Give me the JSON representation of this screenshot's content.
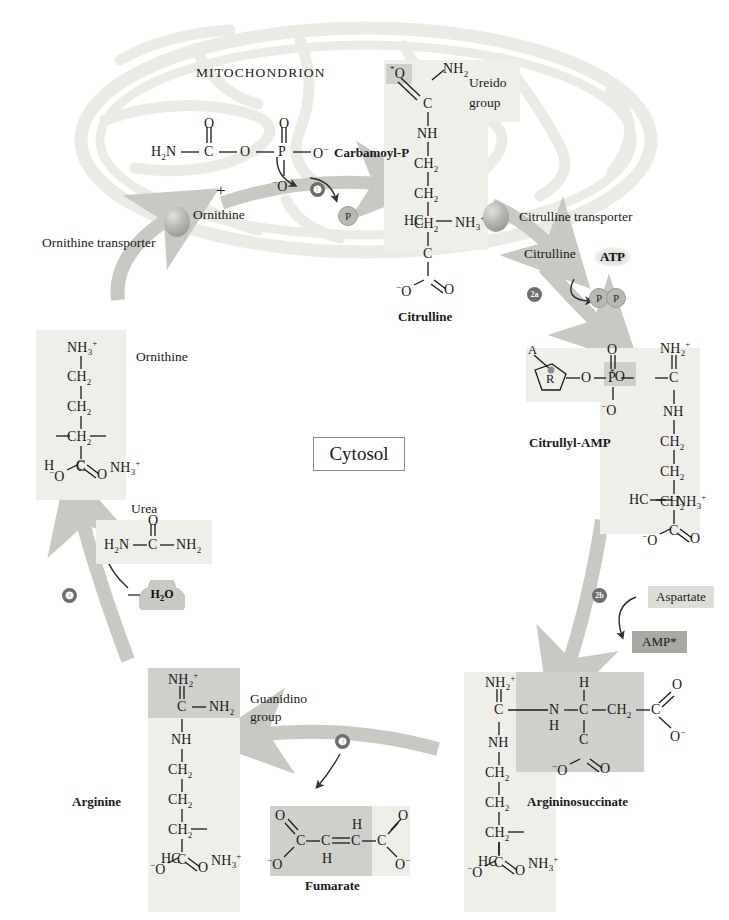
{
  "figure": {
    "compartments": {
      "mitochondrion_label": "MITOCHONDRION",
      "cytosol_label": "Cytosol"
    },
    "transporters": [
      {
        "name": "ornithine-transporter",
        "label": "Ornithine transporter"
      },
      {
        "name": "citrulline-transporter",
        "label": "Citrulline transporter"
      }
    ],
    "steps": [
      {
        "id": "1",
        "glyph": "❶"
      },
      {
        "id": "2a",
        "glyph": "2a"
      },
      {
        "id": "2b",
        "glyph": "2b"
      },
      {
        "id": "3",
        "glyph": "❸"
      },
      {
        "id": "4",
        "glyph": "❹"
      }
    ],
    "colors": {
      "arrow": "#c9c9c4",
      "membrane": "#ebebe6",
      "panel_light": "#efefea",
      "panel_mid": "#cfcfcb",
      "panel_dark": "#a6a6a1",
      "step_badge": "#6e6e6e",
      "text": "#1a1a1a"
    }
  },
  "metabolites": {
    "carbamoyl_p": {
      "label": "Carbamoyl-P",
      "atoms": {
        "h2n": "H",
        "h2n_sub": "2",
        "h2n_n": "N",
        "o_top_left": "O",
        "c": "C",
        "o_bridge": "O",
        "o_top_right": "O",
        "p": "P",
        "o_minus": "O",
        "minus": "−",
        "o_bottom": "O"
      }
    },
    "ornithine_in_mito": {
      "label": "Ornithine",
      "plus": "+"
    },
    "citrulline_mito": {
      "label": "Citrulline",
      "ureido_label_line1": "Ureido",
      "ureido_label_line2": "group",
      "chain": [
        "*O",
        "NH2",
        "C",
        "NH",
        "CH2",
        "CH2",
        "CH2",
        "HC",
        "NH3+",
        "C",
        "-O",
        "O"
      ]
    },
    "citrulline_cytosol": {
      "label": "Citrulline"
    },
    "citrullyl_amp": {
      "label": "Citrullyl-AMP",
      "adenosine_a": "A",
      "ribose_r": "R",
      "chain": [
        "O",
        "P",
        "O",
        "-O",
        "*O",
        "C",
        "NH2+",
        "NH",
        "CH2",
        "CH2",
        "CH2",
        "HC",
        "NH3+",
        "C",
        "-O",
        "O"
      ]
    },
    "argininosuccinate": {
      "label": "Argininosuccinate",
      "chain": [
        "NH2+",
        "C",
        "NH",
        "CH2",
        "CH2",
        "CH2",
        "HC",
        "NH3+",
        "C",
        "-O",
        "O"
      ],
      "succinyl": [
        "N",
        "H",
        "H",
        "C",
        "CH2",
        "C",
        "O",
        "-O",
        "C",
        "-O",
        "O"
      ]
    },
    "fumarate": {
      "label": "Fumarate",
      "atoms": [
        "O",
        "C",
        "-O",
        "C",
        "H",
        "H",
        "C",
        "C",
        "O",
        "-O"
      ]
    },
    "arginine": {
      "label": "Arginine",
      "guanidino_line1": "Guanidino",
      "guanidino_line2": "group",
      "chain": [
        "NH2+",
        "C",
        "NH2",
        "NH",
        "CH2",
        "CH2",
        "CH2",
        "HC",
        "NH3+",
        "C",
        "-O",
        "O"
      ]
    },
    "urea": {
      "label": "Urea",
      "atoms": {
        "o": "O",
        "h2n": "H2N",
        "c": "C",
        "nh2": "NH2"
      }
    },
    "ornithine_cytosol": {
      "label": "Ornithine",
      "chain": [
        "NH3+",
        "CH2",
        "CH2",
        "CH2",
        "H",
        "C",
        "NH3+",
        "C",
        "-O",
        "O"
      ]
    }
  },
  "cofactors": {
    "atp": "ATP",
    "pi": "P",
    "ppi": [
      "P",
      "P"
    ],
    "water": "H2O",
    "aspartate": "Aspartate",
    "amp": "AMP*"
  }
}
